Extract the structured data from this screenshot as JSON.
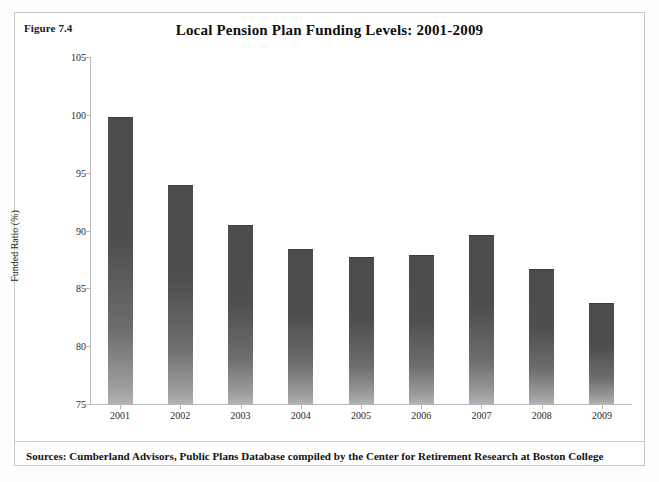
{
  "figure": {
    "number_label": "Figure 7.4",
    "source_note": "Sources: Cumberland Advisors, Public Plans Database compiled by the Center for Retirement Research at Boston College"
  },
  "colors": {
    "bar_top": "#4c4c4c",
    "bar_bottom": "#b2b2b2",
    "axis": "#b9b9b9",
    "frame": "#c8c8c8",
    "text": "#111111"
  },
  "chart_data": {
    "type": "bar",
    "title": "Local Pension Plan Funding Levels: 2001-2009",
    "xlabel": "",
    "ylabel": "Funded Ratio (%)",
    "categories": [
      "2001",
      "2002",
      "2003",
      "2004",
      "2005",
      "2006",
      "2007",
      "2008",
      "2009"
    ],
    "values": [
      99.8,
      93.9,
      90.5,
      88.4,
      87.7,
      87.9,
      89.6,
      86.7,
      83.7
    ],
    "ylim": [
      75,
      105
    ],
    "yticks": [
      75,
      80,
      85,
      90,
      95,
      100,
      105
    ],
    "ytick_labels": [
      "75",
      "80",
      "85",
      "90",
      "95",
      "100",
      "105"
    ],
    "grid": false,
    "legend": false,
    "legend_position": "none"
  }
}
